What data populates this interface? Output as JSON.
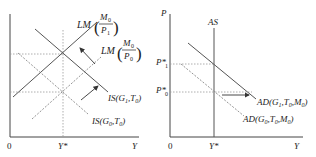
{
  "left_panel": {
    "axis": {
      "origin": "0",
      "x_label": "Y",
      "x_tick": "Y*"
    },
    "curves": {
      "lm_new": {
        "name": "LM",
        "num": "M",
        "num_sub": "0",
        "den": "P",
        "den_sub": "1",
        "style": "solid"
      },
      "lm_old": {
        "name": "LM",
        "num": "M",
        "num_sub": "0",
        "den": "P",
        "den_sub": "0",
        "style": "dashed"
      },
      "is_new": {
        "name": "IS(G",
        "g_sub": "1",
        "t": ",T",
        "t_sub": "0",
        "close": ")",
        "style": "solid"
      },
      "is_old": {
        "name": "IS(G",
        "g_sub": "0",
        "t": ",T",
        "t_sub": "0",
        "close": ")",
        "style": "dashed"
      }
    }
  },
  "right_panel": {
    "axis": {
      "origin": "0",
      "x_label": "Y",
      "y_label": "P",
      "x_tick": "Y*"
    },
    "as_label": "AS",
    "price_ticks": [
      {
        "main": "P*",
        "sub": "1"
      },
      {
        "main": "P*",
        "sub": "0"
      }
    ],
    "curves": {
      "ad_new": {
        "name": "AD(G",
        "g_sub": "1",
        "t": ",T",
        "t_sub": "0",
        "m": ",M",
        "m_sub": "0",
        "close": ")",
        "style": "solid"
      },
      "ad_old": {
        "name": "AD(G",
        "g_sub": "0",
        "t": ",T",
        "t_sub": "0",
        "m": ",M",
        "m_sub": "0",
        "close": ")",
        "style": "dashed"
      }
    }
  },
  "colors": {
    "axis": "#444444",
    "solid": "#555555",
    "dashed": "#888888",
    "dotted": "#999999"
  }
}
